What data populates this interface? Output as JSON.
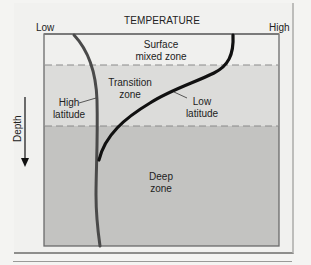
{
  "diagram": {
    "title": "TEMPERATURE",
    "axis": {
      "x_low": "Low",
      "x_high": "High",
      "y_label": "Depth"
    },
    "zones": [
      {
        "line1": "Surface",
        "line2": "mixed zone"
      },
      {
        "line1": "Transition",
        "line2": "zone"
      },
      {
        "line1": "Deep",
        "line2": "zone"
      }
    ],
    "curves": [
      {
        "line1": "High",
        "line2": "latitude"
      },
      {
        "line1": "Low",
        "line2": "latitude"
      }
    ],
    "colors": {
      "surface_zone": "#f0f0ee",
      "transition_zone": "#dcdcda",
      "deep_zone": "#c3c3c1",
      "high_latitude_curve": "#4a4a4a",
      "low_latitude_curve": "#111111",
      "border": "#6b6b6b"
    }
  }
}
